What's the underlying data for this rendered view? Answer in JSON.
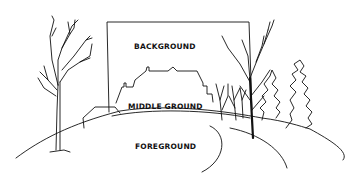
{
  "diagram": {
    "labels": {
      "background": "BACKGROUND",
      "middle_ground": "MIDDLE GROUND",
      "foreground": "FOREGROUND"
    },
    "colors": {
      "ink": "#111111",
      "paper": "#ffffff"
    }
  }
}
